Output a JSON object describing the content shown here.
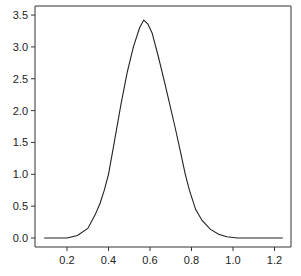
{
  "chart_data": {
    "type": "line",
    "title": "",
    "xlabel": "",
    "ylabel": "",
    "xlim": [
      0.05,
      1.28
    ],
    "ylim": [
      -0.14,
      3.5
    ],
    "grid": false,
    "legend": null,
    "x_ticks": [
      "0.2",
      "0.4",
      "0.6",
      "0.8",
      "1.0",
      "1.2"
    ],
    "y_ticks": [
      "0.0",
      "0.5",
      "1.0",
      "1.5",
      "2.0",
      "2.5",
      "3.0",
      "3.5"
    ],
    "series": [
      {
        "name": "density",
        "color": "#222222",
        "x": [
          0.09,
          0.15,
          0.2,
          0.25,
          0.3,
          0.335,
          0.36,
          0.38,
          0.4,
          0.43,
          0.46,
          0.49,
          0.52,
          0.55,
          0.57,
          0.59,
          0.61,
          0.64,
          0.67,
          0.69,
          0.72,
          0.745,
          0.77,
          0.79,
          0.82,
          0.85,
          0.89,
          0.93,
          0.97,
          1.02,
          1.08,
          1.15,
          1.24
        ],
        "y": [
          0.0,
          0.0,
          0.0,
          0.04,
          0.15,
          0.36,
          0.55,
          0.75,
          1.0,
          1.54,
          2.1,
          2.6,
          3.0,
          3.3,
          3.42,
          3.36,
          3.22,
          2.85,
          2.45,
          2.17,
          1.75,
          1.38,
          1.0,
          0.75,
          0.45,
          0.28,
          0.14,
          0.06,
          0.02,
          0.0,
          0.0,
          0.0,
          0.0
        ]
      }
    ]
  }
}
